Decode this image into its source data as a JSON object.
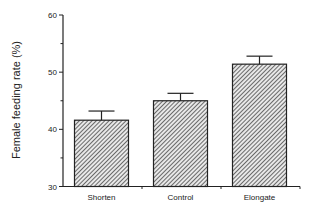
{
  "chart_data": {
    "type": "bar",
    "title": "",
    "xlabel": "",
    "ylabel": "Female feeding rate  (%)",
    "ylim": [
      30,
      60
    ],
    "yticks": [
      30,
      40,
      50,
      60
    ],
    "categories": [
      "Shorten",
      "Control",
      "Elongate"
    ],
    "values": [
      41.6,
      45.0,
      51.4
    ],
    "error_bars": [
      1.6,
      1.3,
      1.4
    ],
    "grid": false,
    "legend": null,
    "bar_fill": "diagonal-hatch",
    "colors": {
      "bar_edge": "#222222",
      "hatch": "#333333",
      "axis": "#222222"
    }
  }
}
